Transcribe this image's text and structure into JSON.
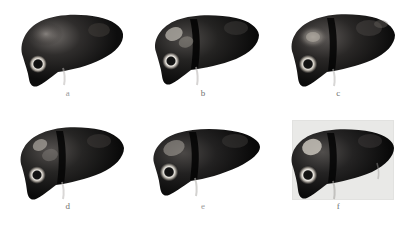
{
  "figure": {
    "background_color": "#ffffff",
    "layout": "2 rows x 3 columns",
    "panels": [
      {
        "label": "a",
        "position": "row1-col1",
        "label_faint": true,
        "has_gray_background": false,
        "description": "smooth glossy liver, specular highlight on left lobe, bright ring lesion lower left",
        "body_fill": "#1b1a1a",
        "body_highlight": "#5c5957",
        "lesion_ring_color": "#e8e4dd",
        "lesion_count": 1,
        "falciform_groove": false
      },
      {
        "label": "b",
        "position": "row1-col2",
        "label_faint": false,
        "has_gray_background": false,
        "description": "flat dark liver with deep falciform groove, two pale blobs on left lobe and ring lesion",
        "body_fill": "#141414",
        "body_highlight": "#4a4746",
        "lesion_ring_color": "#efece6",
        "lesion_count": 3,
        "falciform_groove": true
      },
      {
        "label": "c",
        "position": "row1-col3",
        "label_faint": false,
        "has_gray_background": false,
        "description": "liver with large diffuse halo lesion on left lobe and faint right lobe patches",
        "body_fill": "#191818",
        "body_highlight": "#565251",
        "lesion_ring_color": "#e4e0d8",
        "lesion_count": 3,
        "falciform_groove": true
      },
      {
        "label": "d",
        "position": "row2-col1",
        "label_faint": false,
        "has_gray_background": false,
        "description": "liver with two small dim lesions on left lobe and ring lesion below",
        "body_fill": "#171616",
        "body_highlight": "#4f4c4b",
        "lesion_ring_color": "#e9e5de",
        "lesion_count": 3,
        "falciform_groove": true
      },
      {
        "label": "e",
        "position": "row2-col2",
        "label_faint": true,
        "has_gray_background": false,
        "description": "flatter wider liver with pointed right tip, oval pale lesion and ring lesion",
        "body_fill": "#121212",
        "body_highlight": "#474443",
        "lesion_ring_color": "#ebe8e1",
        "lesion_count": 2,
        "falciform_groove": true
      },
      {
        "label": "f",
        "position": "row2-col3",
        "label_faint": false,
        "has_gray_background": true,
        "background_color": "#e9e9e7",
        "description": "liver rendered on light gray rectangular background with bright lesion and ring lesion",
        "body_fill": "#151414",
        "body_highlight": "#4d4a49",
        "lesion_ring_color": "#f2efe9",
        "lesion_count": 2,
        "falciform_groove": true
      }
    ]
  }
}
